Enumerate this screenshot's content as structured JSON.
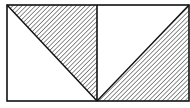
{
  "diagram": {
    "colors": {
      "stroke": "#111111",
      "hatch": "#333333",
      "background": "#ffffff"
    },
    "outer_rect": {
      "x": 7,
      "y": 5,
      "width": 182,
      "height": 96
    },
    "divider_x": 97,
    "left_square": {
      "diagonal": "top-left to bottom-right",
      "hatched_triangle": "upper-right"
    },
    "right_square": {
      "diagonal": "bottom-left to top-right",
      "hatched_triangle": "lower-right"
    },
    "hatch_direction": "diagonal (bottom-left to top-right)"
  }
}
